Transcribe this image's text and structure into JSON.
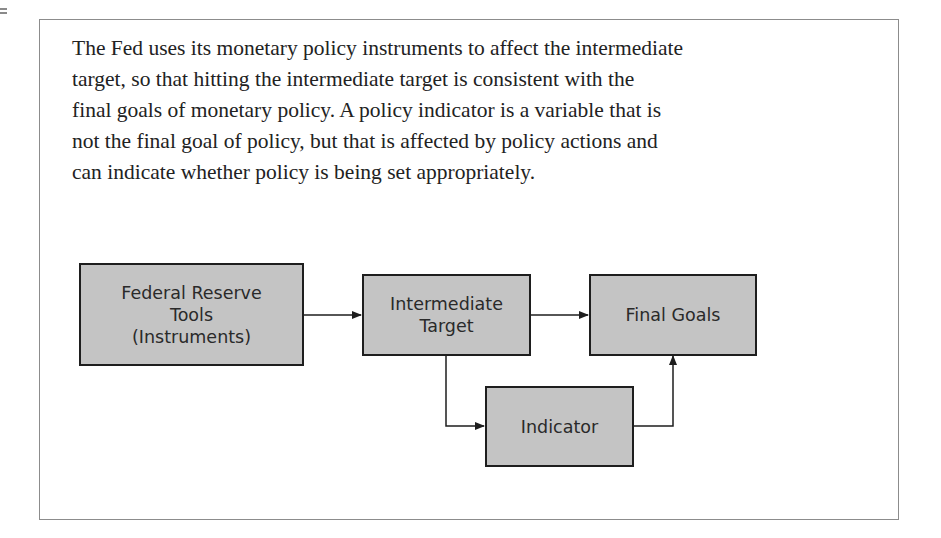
{
  "paragraph": "The Fed uses its monetary policy instruments to affect the intermediate target, so that hitting the intermediate target is consistent with the final goals of monetary policy. A policy indicator is a variable that is not the final goal of policy, but that is affected by policy actions and can indicate whether policy is being set appropriately.",
  "paragraph_lines": [
    "The Fed uses its monetary policy instruments to affect the intermediate",
    "target, so that hitting the intermediate target is consistent with the",
    "final goals of monetary policy. A policy indicator is a variable that is",
    "not the final goal of policy, but that is affected by policy actions and",
    "can indicate whether policy is being set appropriately."
  ],
  "diagram": {
    "nodes": {
      "tools": "Federal Reserve\nTools\n(Instruments)",
      "intermediate": "Intermediate\nTarget",
      "final": "Final Goals",
      "indicator": "Indicator"
    },
    "edges": [
      {
        "from": "tools",
        "to": "intermediate"
      },
      {
        "from": "intermediate",
        "to": "final"
      },
      {
        "from": "intermediate",
        "to": "indicator"
      },
      {
        "from": "indicator",
        "to": "final"
      }
    ],
    "colors": {
      "box_fill": "#c4c4c4",
      "box_border": "#1e1e1e",
      "arrow": "#1e1e1e",
      "frame": "#8c8c8c"
    }
  }
}
